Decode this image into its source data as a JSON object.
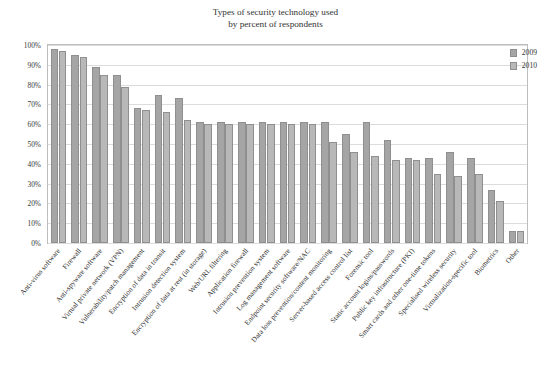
{
  "chart_data": {
    "type": "bar",
    "title": "Types of security technology used by percent of respondents",
    "title_line1": "Types of security technology used",
    "title_line2": "by percent of respondents",
    "xlabel": "",
    "ylabel": "",
    "ylim": [
      0,
      100
    ],
    "ytick_labels": [
      "100%",
      "90%",
      "80%",
      "70%",
      "60%",
      "50%",
      "40%",
      "30%",
      "20%",
      "10%",
      "0%"
    ],
    "ytick_values": [
      100,
      90,
      80,
      70,
      60,
      50,
      40,
      30,
      20,
      10,
      0
    ],
    "grid": true,
    "legend_position": "top-right",
    "colors": {
      "series_2009": "#a5a5a5",
      "series_2010": "#b8b8b8",
      "gridline": "#dcdcdc",
      "frame": "#bdbdbd"
    },
    "categories": [
      "Anti-virus software",
      "Firewall",
      "Anti-spyware software",
      "Virtual private network (VPN)",
      "Vulnerability/patch management",
      "Encryption of data in transit",
      "Intrusion detection system",
      "Encryption of data at rest (in storage)",
      "Web/URL filtering",
      "Application firewall",
      "Intrusion prevention system",
      "Log management software",
      "Endpoint security software/NAC",
      "Data loss prevention/content monitoring",
      "Server-based access control list",
      "Forensic tool",
      "Static account logins/passwords",
      "Public key infrastructure (PKI)",
      "Smart cards and other one-time tokens",
      "Specialised wireless security",
      "Virtualization-specific tool",
      "Biometrics",
      "Other"
    ],
    "series": [
      {
        "name": "2009",
        "color": "#a5a5a5",
        "values": [
          98,
          95,
          89,
          85,
          68,
          75,
          73,
          61,
          61,
          61,
          61,
          61,
          61,
          61,
          55,
          61,
          52,
          43,
          43,
          46,
          43,
          27,
          6
        ]
      },
      {
        "name": "2010",
        "color": "#b8b8b8",
        "values": [
          97,
          94,
          85,
          79,
          67,
          66,
          62,
          60,
          60,
          60,
          60,
          60,
          60,
          51,
          46,
          44,
          42,
          42,
          35,
          34,
          35,
          21,
          6
        ]
      }
    ]
  },
  "legend": {
    "items": [
      {
        "label": "2009",
        "swatch": "legend-swatch-2009"
      },
      {
        "label": "2010",
        "swatch": "legend-swatch-2010"
      }
    ]
  }
}
